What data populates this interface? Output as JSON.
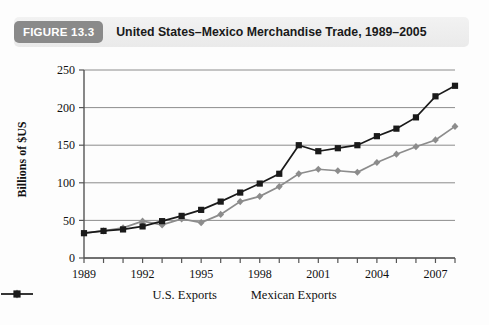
{
  "header": {
    "badge": "FIGURE 13.3",
    "title": "United States–Mexico Merchandise Trade, 1989–2005"
  },
  "colors": {
    "badge_bg": "#8a8a8a",
    "header_bg": "#eeeeee",
    "us_exports": "#8c8c8c",
    "mexican_exports": "#1a1a1a",
    "gridline": "#808080",
    "axis": "#555555",
    "page_bg": "#fdfdfd"
  },
  "chart_data": {
    "type": "line",
    "title": "United States–Mexico Merchandise Trade, 1989–2005",
    "xlabel": "",
    "ylabel": "Billions of $US",
    "ylim": [
      0,
      250
    ],
    "yticks": [
      0,
      50,
      100,
      150,
      200,
      250
    ],
    "ytick_labels": [
      "0",
      "50",
      "100",
      "150",
      "200",
      "250"
    ],
    "xlim": [
      1989,
      2008
    ],
    "x": [
      1989,
      1990,
      1991,
      1992,
      1993,
      1994,
      1995,
      1996,
      1997,
      1998,
      1999,
      2000,
      2001,
      2002,
      2003,
      2004,
      2005,
      2006,
      2007,
      2008
    ],
    "xticks": [
      1989,
      1990,
      1991,
      1992,
      1993,
      1994,
      1995,
      1996,
      1997,
      1998,
      1999,
      2000,
      2001,
      2002,
      2003,
      2004,
      2005,
      2006,
      2007,
      2008
    ],
    "xtick_labels_shown": [
      "1989",
      "1992",
      "1995",
      "1998",
      "2001",
      "2004",
      "2007"
    ],
    "grid": "horizontal",
    "legend_position": "bottom",
    "series": [
      {
        "name": "U.S. Exports",
        "marker": "diamond",
        "color": "#8c8c8c",
        "values": [
          33,
          36,
          40,
          49,
          44,
          52,
          47,
          58,
          75,
          82,
          95,
          112,
          118,
          116,
          114,
          127,
          138,
          148,
          157,
          175
        ]
      },
      {
        "name": "Mexican Exports",
        "marker": "square",
        "color": "#1a1a1a",
        "values": [
          33,
          36,
          38,
          42,
          49,
          56,
          64,
          75,
          87,
          99,
          112,
          150,
          142,
          146,
          150,
          162,
          172,
          187,
          215,
          229
        ]
      }
    ]
  },
  "legend": {
    "items": [
      {
        "label": "U.S. Exports",
        "marker": "diamond",
        "color": "#8c8c8c"
      },
      {
        "label": "Mexican Exports",
        "marker": "square",
        "color": "#1a1a1a"
      }
    ]
  }
}
